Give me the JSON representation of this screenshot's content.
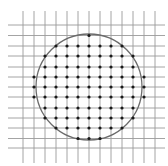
{
  "diagram": {
    "width": 168,
    "height": 166,
    "background": "#ffffff",
    "grid": {
      "color": "#9a9a9a",
      "stroke_width": 0.9,
      "vertical_lines_x": [
        23,
        34,
        45,
        56,
        67,
        78,
        89,
        100,
        111,
        122,
        133,
        144,
        155
      ],
      "vertical_extent_y": [
        11,
        163
      ],
      "horizontal_lines_y": [
        25,
        35.5,
        46,
        56,
        67,
        77,
        87,
        97,
        108,
        118,
        128,
        138.5,
        148
      ],
      "horizontal_extent_x": [
        8,
        165
      ]
    },
    "circle": {
      "cx": 89,
      "cy": 87,
      "r": 53,
      "color": "#6b6b6b",
      "stroke_width": 1.3
    },
    "points": {
      "color": "#1a1a1a",
      "radius": 1.6,
      "rows": [
        {
          "y": 35.5,
          "x": [
            89
          ]
        },
        {
          "y": 46,
          "x": [
            56,
            67,
            78,
            89,
            100,
            111,
            122
          ]
        },
        {
          "y": 56,
          "x": [
            45,
            56,
            67,
            78,
            89,
            100,
            111,
            122,
            133
          ]
        },
        {
          "y": 67,
          "x": [
            45,
            56,
            67,
            78,
            89,
            100,
            111,
            122,
            133
          ]
        },
        {
          "y": 77,
          "x": [
            34,
            45,
            56,
            67,
            78,
            89,
            100,
            111,
            122,
            133,
            144
          ]
        },
        {
          "y": 87,
          "x": [
            34,
            45,
            56,
            67,
            78,
            89,
            100,
            111,
            122,
            133,
            144
          ]
        },
        {
          "y": 97,
          "x": [
            34,
            45,
            56,
            67,
            78,
            89,
            100,
            111,
            122,
            133,
            144
          ]
        },
        {
          "y": 108,
          "x": [
            45,
            56,
            67,
            78,
            89,
            100,
            111,
            122,
            133
          ]
        },
        {
          "y": 118,
          "x": [
            45,
            56,
            67,
            78,
            89,
            100,
            111,
            122,
            133
          ]
        },
        {
          "y": 128,
          "x": [
            56,
            67,
            78,
            89,
            100,
            111,
            122
          ]
        },
        {
          "y": 138.5,
          "x": [
            78,
            89,
            100
          ]
        }
      ]
    }
  }
}
